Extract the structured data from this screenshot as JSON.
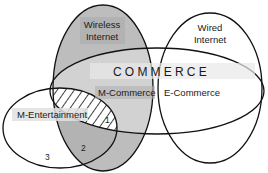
{
  "diagram": {
    "title": "COMMERCE",
    "sets": {
      "wireless": {
        "line1": "Wireless",
        "line2": "Internet",
        "fill": "#b8b8b8"
      },
      "wired": {
        "line1": "Wired",
        "line2": "Internet",
        "fill": "#ffffff"
      },
      "commerce": {
        "label": "COMMERCE",
        "band": "#e6e6e6"
      },
      "m_entertainment": {
        "label": "M-Entertainment"
      }
    },
    "regions": {
      "m_commerce": "M-Commerce",
      "e_commerce": "E-Commerce",
      "region_1": "1",
      "region_2": "2",
      "region_3": "3"
    },
    "colors": {
      "stroke": "#111111",
      "wireless_fill": "#b8b8b8",
      "overlap_fill": "#a6a6a6",
      "label_band": "#dcdcdc"
    }
  }
}
